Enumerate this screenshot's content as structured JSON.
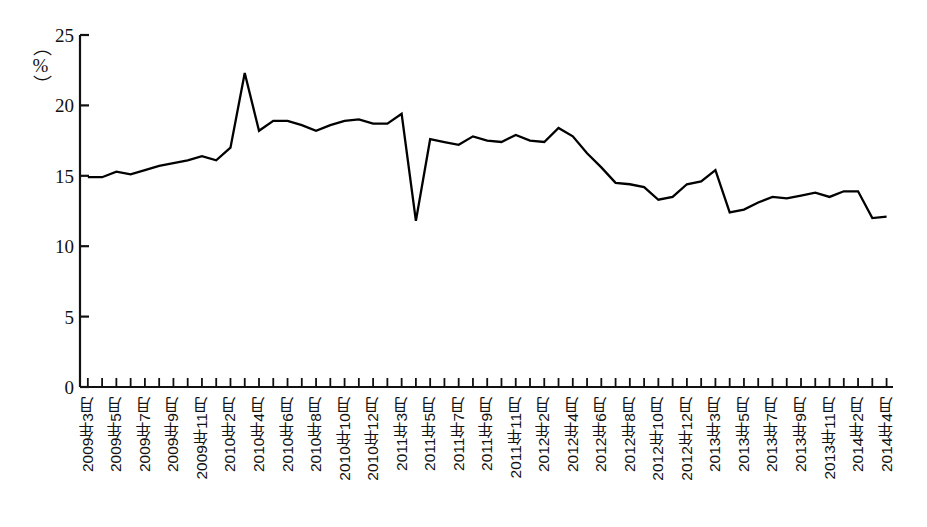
{
  "chart_data": {
    "type": "line",
    "title": "",
    "xlabel": "",
    "ylabel": "%",
    "ylim": [
      0,
      25
    ],
    "yticks": [
      0,
      5,
      10,
      15,
      20,
      25
    ],
    "grid": false,
    "legend": "none",
    "series_color": "#000000",
    "categories": [
      "2009年3月",
      "2009年4月",
      "2009年5月",
      "2009年6月",
      "2009年7月",
      "2009年8月",
      "2009年9月",
      "2009年10月",
      "2009年11月",
      "2009年12月",
      "2010年2月",
      "2010年3月",
      "2010年4月",
      "2010年5月",
      "2010年6月",
      "2010年7月",
      "2010年8月",
      "2010年9月",
      "2010年10月",
      "2010年11月",
      "2010年12月",
      "2011年2月",
      "2011年3月",
      "2011年4月",
      "2011年5月",
      "2011年6月",
      "2011年7月",
      "2011年8月",
      "2011年9月",
      "2011年10月",
      "2011年11月",
      "2011年12月",
      "2012年2月",
      "2012年3月",
      "2012年4月",
      "2012年5月",
      "2012年6月",
      "2012年7月",
      "2012年8月",
      "2012年9月",
      "2012年10月",
      "2012年11月",
      "2012年12月",
      "2013年2月",
      "2013年3月",
      "2013年4月",
      "2013年5月",
      "2013年6月",
      "2013年7月",
      "2013年8月",
      "2013年9月",
      "2013年10月",
      "2013年11月",
      "2013年12月",
      "2014年2月",
      "2014年3月",
      "2014年4月"
    ],
    "values": [
      14.9,
      14.9,
      15.3,
      15.1,
      15.4,
      15.7,
      15.9,
      16.1,
      16.4,
      16.1,
      17.0,
      22.3,
      18.2,
      18.9,
      18.9,
      18.6,
      18.2,
      18.6,
      18.9,
      19.0,
      18.7,
      18.7,
      19.4,
      11.8,
      17.6,
      17.4,
      17.2,
      17.8,
      17.5,
      17.4,
      17.9,
      17.5,
      17.4,
      18.4,
      17.8,
      16.6,
      15.6,
      14.5,
      14.4,
      14.2,
      13.3,
      13.5,
      14.4,
      14.6,
      15.4,
      12.4,
      12.6,
      13.1,
      13.5,
      13.4,
      13.6,
      13.8,
      13.5,
      13.9,
      13.9,
      12.0,
      12.1
    ],
    "xtick_labels": [
      "2009年3月",
      "2009年5月",
      "2009年7月",
      "2009年9月",
      "2009年11月",
      "2010年2月",
      "2010年4月",
      "2010年6月",
      "2010年8月",
      "2010年10月",
      "2010年12月",
      "2011年3月",
      "2011年5月",
      "2011年7月",
      "2011年9月",
      "2011年11月",
      "2012年2月",
      "2012年4月",
      "2012年6月",
      "2012年8月",
      "2012年10月",
      "2012年12月",
      "2013年3月",
      "2013年5月",
      "2013年7月",
      "2013年9月",
      "2013年11月",
      "2014年2月",
      "2014年4月"
    ]
  },
  "axis": {
    "unit_label": "（%）",
    "y_tick_labels": [
      "25",
      "20",
      "15",
      "10",
      "5",
      "0"
    ]
  }
}
